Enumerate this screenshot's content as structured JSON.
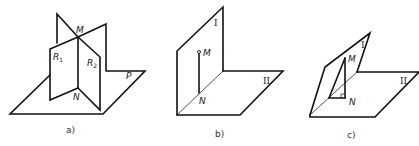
{
  "figure": {
    "panels": [
      {
        "id": "a",
        "caption": "a)",
        "labels": {
          "M": "M",
          "N": "N",
          "R1": "R",
          "R1_sub": "1",
          "R2": "R",
          "R2_sub": "2",
          "P": "P"
        },
        "description": "Two planes R1 and R2 intersecting along line MN, both perpendicular to plane P"
      },
      {
        "id": "b",
        "caption": "b)",
        "labels": {
          "M": "M",
          "N": "N",
          "plane1": "I",
          "plane2": "II"
        },
        "description": "Dihedral right angle: vertical plane I and horizontal plane II, segment MN in plane I perpendicular to edge"
      },
      {
        "id": "c",
        "caption": "c)",
        "labels": {
          "M": "M",
          "N": "N",
          "plane1": "I",
          "plane2": "II"
        },
        "description": "Inclined plane I over plane II with perpendicular MN dropped onto plane II, right-angle mark at N"
      }
    ],
    "colors": {
      "line": "#111111",
      "background": "#ffffff"
    }
  }
}
